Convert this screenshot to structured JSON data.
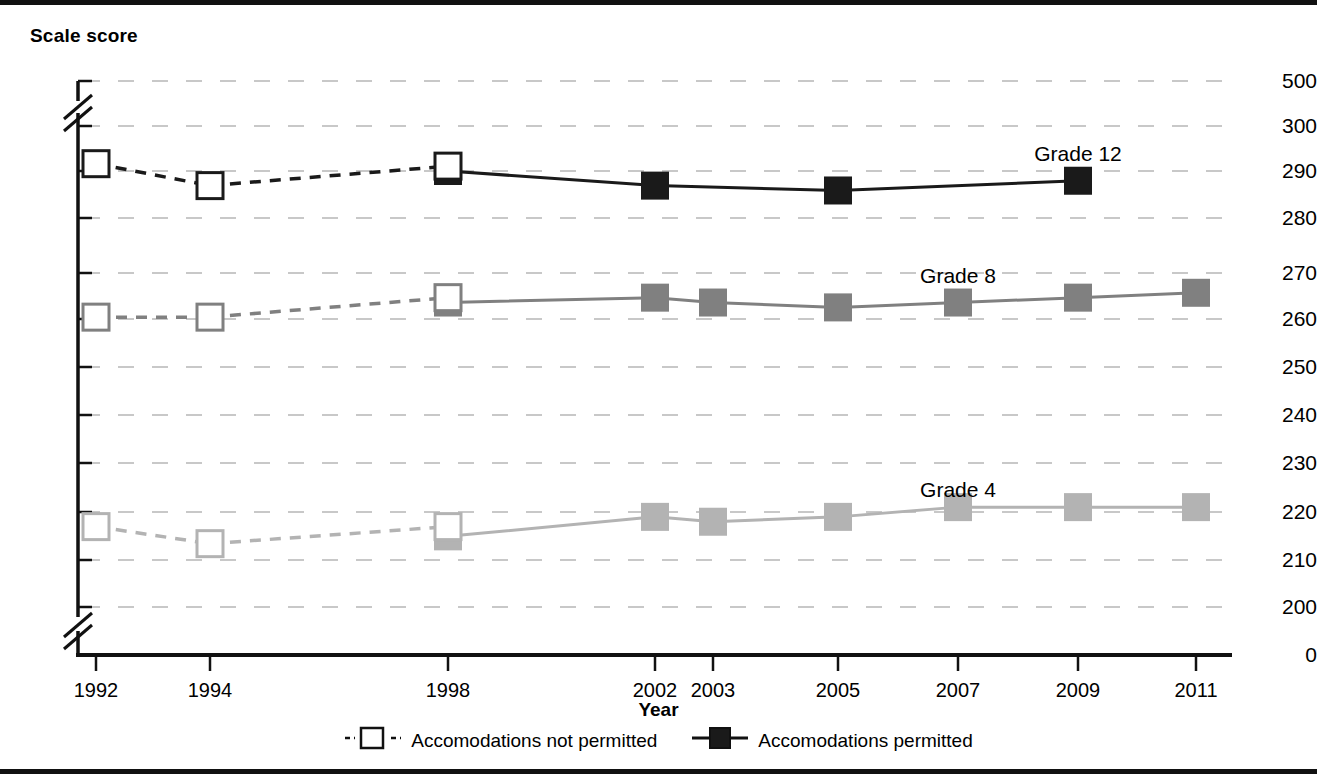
{
  "axis_title_y": "Scale score",
  "axis_title_x": "Year",
  "legend": {
    "items": [
      {
        "label": "Accomodations not permitted",
        "swatch": "open-square-dashed-icon"
      },
      {
        "label": "Accomodations permitted",
        "swatch": "filled-square-solid-icon"
      }
    ]
  },
  "colors": {
    "grade12": "#1a1a1a",
    "grade8": "#808080",
    "grade4": "#b3b3b3",
    "gridline": "#c8c8c8",
    "axis": "#111111",
    "background": "#ffffff"
  },
  "chart_data": {
    "type": "line",
    "title": "",
    "xlabel": "Year",
    "ylabel": "Scale score",
    "grid": true,
    "legend_position": "bottom",
    "x": [
      "1992",
      "1994",
      "1998",
      "2002",
      "2003",
      "2005",
      "2007",
      "2009",
      "2011"
    ],
    "xtick_labels": [
      "1992",
      "1994",
      "1998",
      "2002",
      "2003",
      "2005",
      "2007",
      "2009",
      "2011"
    ],
    "ytick_labels": [
      "0",
      "200",
      "210",
      "220",
      "230",
      "240",
      "250",
      "260",
      "270",
      "280",
      "290",
      "300",
      "500"
    ],
    "ylim": [
      200,
      300
    ],
    "axis_breaks": [
      "between 0 and 200",
      "between 300 and 500"
    ],
    "series": [
      {
        "name": "Grade 12",
        "color": "#1a1a1a",
        "label_x": "2009",
        "label_y": 293.5,
        "not_permitted": [
          {
            "x": "1992",
            "y": 291.5
          },
          {
            "x": "1994",
            "y": 287
          },
          {
            "x": "1998",
            "y": 291
          }
        ],
        "permitted": [
          {
            "x": "1998",
            "y": 290
          },
          {
            "x": "2002",
            "y": 287
          },
          {
            "x": "2005",
            "y": 286
          },
          {
            "x": "2009",
            "y": 288
          }
        ]
      },
      {
        "name": "Grade 8",
        "color": "#808080",
        "label_x": "2007",
        "label_y": 268.5,
        "not_permitted": [
          {
            "x": "1992",
            "y": 260
          },
          {
            "x": "1994",
            "y": 260
          },
          {
            "x": "1998",
            "y": 264
          }
        ],
        "permitted": [
          {
            "x": "1998",
            "y": 263
          },
          {
            "x": "2002",
            "y": 264
          },
          {
            "x": "2003",
            "y": 263
          },
          {
            "x": "2005",
            "y": 262
          },
          {
            "x": "2007",
            "y": 263
          },
          {
            "x": "2009",
            "y": 264
          },
          {
            "x": "2011",
            "y": 265
          }
        ]
      },
      {
        "name": "Grade 4",
        "color": "#b3b3b3",
        "label_x": "2007",
        "label_y": 224.5,
        "not_permitted": [
          {
            "x": "1992",
            "y": 217
          },
          {
            "x": "1994",
            "y": 213.5
          },
          {
            "x": "1998",
            "y": 217
          }
        ],
        "permitted": [
          {
            "x": "1998",
            "y": 215
          },
          {
            "x": "2002",
            "y": 219
          },
          {
            "x": "2003",
            "y": 218
          },
          {
            "x": "2005",
            "y": 219
          },
          {
            "x": "2007",
            "y": 221
          },
          {
            "x": "2009",
            "y": 221
          },
          {
            "x": "2011",
            "y": 221
          }
        ]
      }
    ]
  },
  "geometry": {
    "x_positions": {
      "1992": 96,
      "1994": 210,
      "1998": 448,
      "2002": 655,
      "2003": 713,
      "2005": 838,
      "2007": 958,
      "2009": 1078,
      "2011": 1196
    },
    "y_positions": {
      "500": 76,
      "300": 121,
      "290": 166,
      "280": 213,
      "270": 268,
      "260": 314,
      "250": 362,
      "240": 410,
      "230": 458,
      "220": 507,
      "210": 555,
      "200": 602,
      "0": 650
    },
    "plot_left": 78,
    "plot_right": 1228,
    "grid_rows": [
      76,
      121,
      166,
      213,
      268,
      314,
      362,
      410,
      458,
      507,
      555,
      602
    ]
  }
}
